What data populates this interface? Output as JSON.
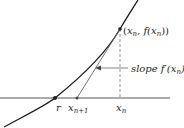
{
  "diagram": {
    "colors": {
      "curve": "#1a1a1a",
      "axis": "#555555",
      "tangent": "#666666",
      "dashed": "#777777",
      "arrow": "#666666",
      "point": "#222222",
      "text": "#222222"
    },
    "labels": {
      "point_label": "(xₙ, f(xₙ))",
      "point_label_parts": {
        "open": "(",
        "x": "x",
        "sub": "n",
        "comma": ", f(",
        "x2": "x",
        "sub2": "n",
        "close": "))"
      },
      "slope_prefix": "slope ",
      "slope_func": "f′(",
      "slope_x": "x",
      "slope_sub": "n",
      "slope_close": ")",
      "root": "r",
      "x_next": "x",
      "x_next_sub": "n+1",
      "x_n": "x",
      "x_n_sub": "n"
    },
    "points": {
      "root": {
        "x": 55,
        "y": 98
      },
      "x_next": {
        "x": 77,
        "y": 98
      },
      "tangent_point": {
        "x": 120,
        "y": 29
      },
      "x_n_foot": {
        "x": 120,
        "y": 98
      }
    }
  }
}
